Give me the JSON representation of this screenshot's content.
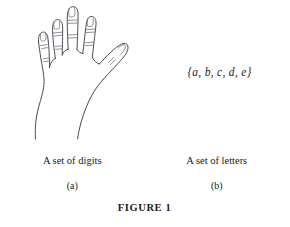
{
  "figure": {
    "caption": "FIGURE 1",
    "panels": [
      {
        "id": "a",
        "sublabel": "(a)",
        "caption": "A set of digits",
        "artwork": "hand-illustration",
        "artwork_description": "Line drawing of an open hand showing five digits",
        "digit_count": 5
      },
      {
        "id": "b",
        "sublabel": "(b)",
        "caption": "A set of letters",
        "artwork": "set-notation",
        "set_notation": "{a, b, c, d, e}",
        "set_elements": [
          "a",
          "b",
          "c",
          "d",
          "e"
        ],
        "element_count": 5
      }
    ]
  },
  "colors": {
    "background": "#ffffff",
    "ink": "#1a1a1a",
    "line": "#4a4a52",
    "line_light": "#6b6b73"
  }
}
